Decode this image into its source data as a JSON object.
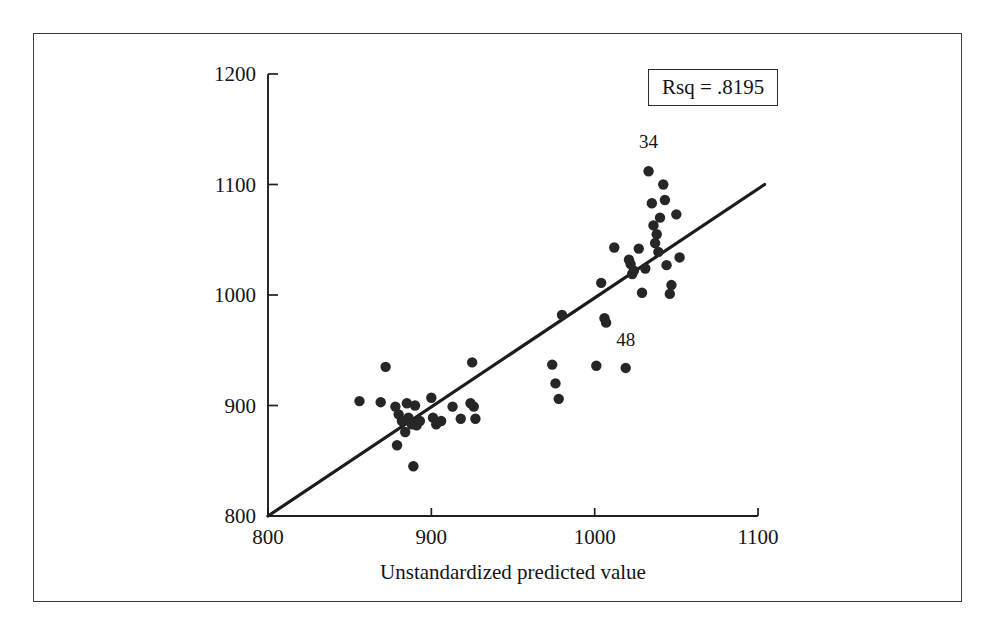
{
  "figure": {
    "frame_visible": true,
    "background_color": "#ffffff",
    "ink_color": "#1a1a1a"
  },
  "annotation_box": {
    "text": "Rsq = .8195",
    "border_color": "#2b2b2b"
  },
  "chart_data": {
    "type": "scatter",
    "title": "",
    "subtitle": "",
    "xlabel": "Unstandardized predicted value",
    "ylabel": "",
    "xlim": [
      800,
      1100
    ],
    "ylim": [
      800,
      1200
    ],
    "xticks": [
      800,
      900,
      1000,
      1100
    ],
    "yticks": [
      800,
      900,
      1000,
      1100,
      1200
    ],
    "xtick_labels": [
      "800",
      "900",
      "1000",
      "1100"
    ],
    "ytick_labels": [
      "800",
      "900",
      "1000",
      "1100",
      "1200"
    ],
    "grid": false,
    "legend": false,
    "legend_position": "none",
    "annotations": [
      {
        "text": "Rsq = .8195",
        "x": 1035,
        "y": 1163,
        "boxed": true
      },
      {
        "text": "34",
        "x": 1033,
        "y": 1133,
        "boxed": false
      },
      {
        "text": "48",
        "x": 1019,
        "y": 954,
        "boxed": false
      }
    ],
    "series": [
      {
        "name": "observations",
        "marker": "filled-circle",
        "color": "#262626",
        "points": [
          [
            856,
            904
          ],
          [
            872,
            935
          ],
          [
            869,
            903
          ],
          [
            878,
            899
          ],
          [
            880,
            892
          ],
          [
            882,
            886
          ],
          [
            886,
            889
          ],
          [
            888,
            883
          ],
          [
            884,
            876
          ],
          [
            885,
            902
          ],
          [
            890,
            900
          ],
          [
            891,
            882
          ],
          [
            893,
            886
          ],
          [
            879,
            864
          ],
          [
            889,
            845
          ],
          [
            900,
            907
          ],
          [
            901,
            889
          ],
          [
            903,
            883
          ],
          [
            906,
            886
          ],
          [
            913,
            899
          ],
          [
            918,
            888
          ],
          [
            924,
            902
          ],
          [
            926,
            899
          ],
          [
            925,
            939
          ],
          [
            927,
            888
          ],
          [
            974,
            937
          ],
          [
            976,
            920
          ],
          [
            978,
            906
          ],
          [
            980,
            982
          ],
          [
            1001,
            936
          ],
          [
            1004,
            1011
          ],
          [
            1006,
            979
          ],
          [
            1007,
            975
          ],
          [
            1019,
            934
          ],
          [
            1021,
            1032
          ],
          [
            1022,
            1028
          ],
          [
            1023,
            1019
          ],
          [
            1024,
            1022
          ],
          [
            1027,
            1042
          ],
          [
            1012,
            1043
          ],
          [
            1029,
            1002
          ],
          [
            1031,
            1024
          ],
          [
            1033,
            1112
          ],
          [
            1035,
            1083
          ],
          [
            1036,
            1063
          ],
          [
            1037,
            1047
          ],
          [
            1038,
            1055
          ],
          [
            1039,
            1039
          ],
          [
            1040,
            1070
          ],
          [
            1042,
            1100
          ],
          [
            1043,
            1086
          ],
          [
            1044,
            1027
          ],
          [
            1046,
            1001
          ],
          [
            1047,
            1009
          ],
          [
            1050,
            1073
          ],
          [
            1052,
            1034
          ]
        ]
      }
    ],
    "fit_line": {
      "name": "regression-line",
      "color": "#1c1c1c",
      "x_start": 800,
      "y_start": 800,
      "x_end": 1104,
      "y_end": 1100
    }
  }
}
